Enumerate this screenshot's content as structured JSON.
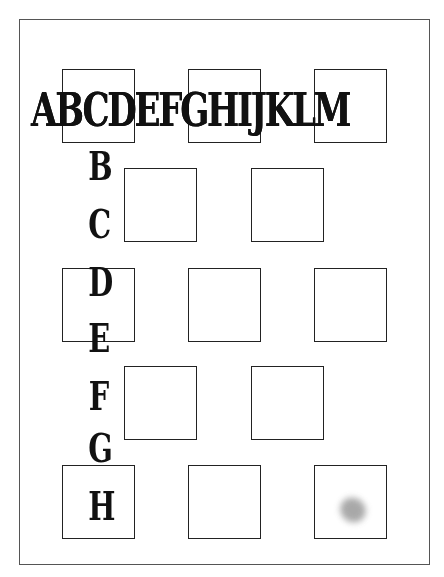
{
  "page": {
    "border_color": "#555555",
    "background": "#ffffff"
  },
  "header": {
    "letters": "ABCDEFGHIJKLM"
  },
  "vertical_letters": [
    "B",
    "C",
    "D",
    "E",
    "F",
    "G",
    "H"
  ],
  "grid": {
    "rows": [
      {
        "row": 1,
        "squares": 3,
        "offset": "left"
      },
      {
        "row": 2,
        "squares": 2,
        "offset": "indented"
      },
      {
        "row": 3,
        "squares": 3,
        "offset": "left"
      },
      {
        "row": 4,
        "squares": 2,
        "offset": "indented"
      },
      {
        "row": 5,
        "squares": 3,
        "offset": "left"
      }
    ]
  },
  "marks": {
    "smudge_color": "#9a9a9a"
  }
}
